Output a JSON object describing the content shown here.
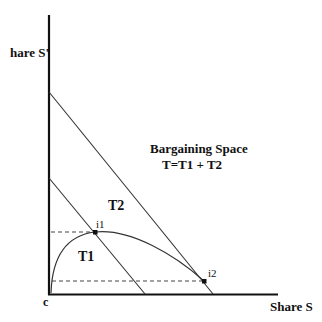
{
  "diagram": {
    "axes": {
      "y_label": "hare S'",
      "x_label": "Share S",
      "origin_label": "c"
    },
    "region_title": "Bargaining Space",
    "region_formula": "T=T1 + T2",
    "regions": {
      "t1": "T1",
      "t2": "T2"
    },
    "points": {
      "i1": "i1",
      "i2": "i2"
    },
    "colors": {
      "axis": "#111111",
      "line": "#333333",
      "dashed": "#444444",
      "text": "#111111"
    }
  }
}
